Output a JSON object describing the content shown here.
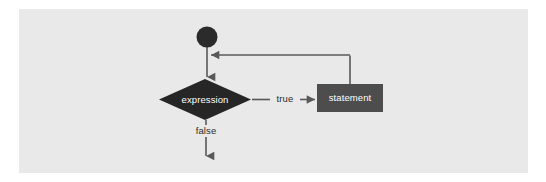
{
  "figure": {
    "kind": "flowchart",
    "canvas": {
      "width": 546,
      "height": 182
    },
    "colors": {
      "page_background": "#ffffff",
      "panel_background": "#e9e9e9",
      "decision_fill": "#262626",
      "statement_fill": "#4d4d4d",
      "start_node_fill": "#2b2b2b",
      "connector_stroke": "#585858",
      "node_text": "#ffffff",
      "edge_text": "#2b2b2b"
    },
    "panel": {
      "x": 19,
      "y": 9,
      "width": 509,
      "height": 164
    },
    "nodes": {
      "start": {
        "label": "",
        "shape": "circle",
        "cx": 207,
        "cy": 37,
        "r": 10
      },
      "decision": {
        "label": "expression",
        "shape": "diamond",
        "cx": 205,
        "cy": 100,
        "half_width": 45,
        "half_height": 20
      },
      "statement": {
        "label": "statement",
        "shape": "rect",
        "x": 317,
        "y": 84,
        "width": 66,
        "height": 28
      }
    },
    "edges": {
      "start_to_decision": {
        "label": "",
        "from": "start",
        "to": "decision"
      },
      "decision_true": {
        "label": "true",
        "from": "decision",
        "to": "statement",
        "label_x": 285,
        "label_y": 99
      },
      "decision_false": {
        "label": "false",
        "from": "decision",
        "to": "exit",
        "label_x": 206,
        "label_y": 131
      },
      "loop_back": {
        "label": "",
        "from": "statement",
        "to": "start_to_decision",
        "y": 55,
        "x_from": 350,
        "x_to": 209
      }
    }
  }
}
